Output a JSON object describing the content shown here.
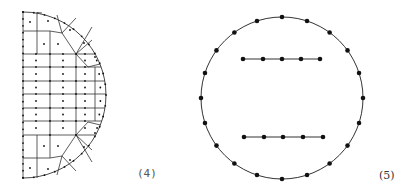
{
  "figures": [
    {
      "id": "4",
      "label": "(4)",
      "description": "Half-disk finite element mesh: structured rectangular grid in the center with curved quadrilateral elements along the circular boundary; nodes shown as dots on edges and element centers",
      "boundary": {
        "type": "semicircle",
        "center": [
          23,
          95
        ],
        "radius": 83,
        "side": "right"
      },
      "grid_x": [
        23,
        50,
        76,
        95
      ],
      "grid_y": [
        12,
        31,
        54,
        67,
        81,
        94,
        108,
        121,
        135,
        158,
        178
      ]
    },
    {
      "id": "5",
      "label": "(5)",
      "description": "Circle with 20 boundary nodes and two horizontal interior segments of 5 nodes each",
      "circle": {
        "center": [
          282,
          98
        ],
        "radius": 81,
        "node_count": 20
      },
      "segments": [
        {
          "y": 59,
          "x": [
            243,
            263,
            282,
            301,
            320
          ]
        },
        {
          "y": 137,
          "x": [
            244,
            264,
            283,
            303,
            323
          ]
        }
      ]
    }
  ],
  "labels": {
    "fig4": "(4)",
    "fig5": "(5)"
  },
  "colors": {
    "line": "#333333",
    "node": "#111111",
    "background": "#ffffff"
  }
}
